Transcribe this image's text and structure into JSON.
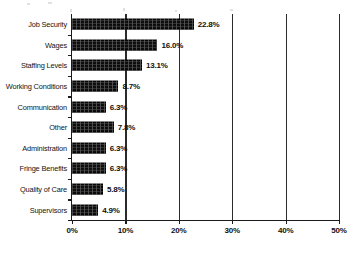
{
  "chart_data": {
    "type": "bar",
    "orientation": "horizontal",
    "title": "",
    "xlabel": "",
    "ylabel": "",
    "xlim": [
      0,
      50
    ],
    "xticks": [
      0,
      10,
      20,
      30,
      40,
      50
    ],
    "xtick_labels": [
      "0%",
      "10%",
      "20%",
      "30%",
      "40%",
      "50%"
    ],
    "grid": true,
    "legend": "none",
    "bar_color": "#0d0d0d",
    "categories": [
      "Job Security",
      "Wages",
      "Staffing Levels",
      "Working Conditions",
      "Communication",
      "Other",
      "Administration",
      "Fringe Benefits",
      "Quality of Care",
      "Supervisors"
    ],
    "values": [
      22.8,
      16.0,
      13.1,
      8.7,
      6.3,
      7.8,
      6.3,
      6.3,
      5.8,
      4.9
    ],
    "data_labels": [
      "22.8%",
      "16.0%",
      "13.1%",
      "8.7%",
      "6.3%",
      "7.8%",
      "6.3%",
      "6.3%",
      "5.8%",
      "4.9%"
    ]
  }
}
